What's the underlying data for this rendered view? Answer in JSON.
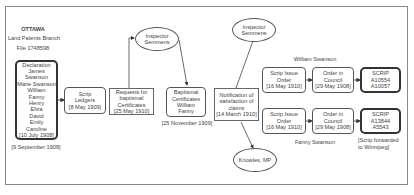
{
  "header": {
    "title": "OTTAWA",
    "subtitle": "Land Patents Branch",
    "file": "File 1748598"
  },
  "nodes": {
    "declaration": {
      "lines": [
        "Declaration",
        "James Swanson",
        "Marie Swanson",
        "William",
        "Fanny",
        "Henry",
        "Eliza",
        "David",
        "Emily",
        "Caroline",
        "[10 July 1908]"
      ],
      "caption": "[9 September 1908]"
    },
    "scrip_ledgers": {
      "lines": [
        "Scrip",
        "Ledgers",
        "[8 May 1909]"
      ]
    },
    "requests": {
      "lines": [
        "Requests for",
        "baptismal",
        "Certificates",
        "[25 May 1910]"
      ]
    },
    "inspector_1": {
      "lines": [
        "Inspector",
        "Semmens"
      ]
    },
    "baptismal": {
      "lines": [
        "Baptismal",
        "Certificates",
        "William",
        "Fanny"
      ],
      "caption": "[25 November 1909]"
    },
    "notification": {
      "lines": [
        "Notification of",
        "satisfaction of",
        "claims",
        "[14 March 1910]"
      ]
    },
    "inspector_2": {
      "lines": [
        "Inspector",
        "Semmens"
      ]
    },
    "knowles": {
      "lines": [
        "Knowles, MP"
      ]
    },
    "william": {
      "label": "William Swanson",
      "scrip_issue": {
        "lines": [
          "Scrip Issue",
          "Order",
          "[16 May 1910]"
        ]
      },
      "order_council": {
        "lines": [
          "Order in",
          "Council",
          "[29 May 1908]"
        ]
      },
      "scrip": {
        "lines": [
          "SCRIP",
          "A10554",
          "A10057"
        ]
      }
    },
    "fanny": {
      "label": "Fanny Swanson",
      "scrip_issue": {
        "lines": [
          "Scrip Issue",
          "Order",
          "[16 May 1910]"
        ]
      },
      "order_council": {
        "lines": [
          "Order in",
          "Council",
          "[29 May 1908]"
        ]
      },
      "scrip": {
        "lines": [
          "SCRIP",
          "A13844",
          "A5543"
        ]
      },
      "note": [
        "[Scrip forwarded",
        "to Winnipeg]"
      ]
    }
  },
  "colors": {
    "line": "#444444",
    "box_border": "#555555",
    "text": "#444444"
  }
}
